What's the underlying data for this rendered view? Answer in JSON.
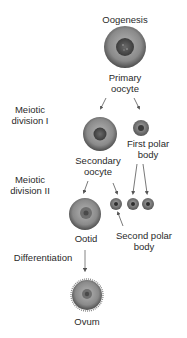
{
  "title": "Oogenesis",
  "stages": {
    "primary_oocyte": "Primary\noocyte",
    "secondary_oocyte": "Secondary\noocyte",
    "first_polar_body": "First polar\nbody",
    "ootid": "Ootid",
    "second_polar_body": "Second polar\nbody",
    "ovum": "Ovum"
  },
  "phases": {
    "meiotic_division_1": "Meiotic\ndivision I",
    "meiotic_division_2": "Meiotic\ndivision II",
    "differentiation": "Differentiation"
  },
  "colors": {
    "cell_outer": "#5a5a5a",
    "cell_mid": "#8c8c8c",
    "nucleus": "#4a4a4a",
    "arrow": "#555555",
    "text": "#2a2a2a"
  }
}
